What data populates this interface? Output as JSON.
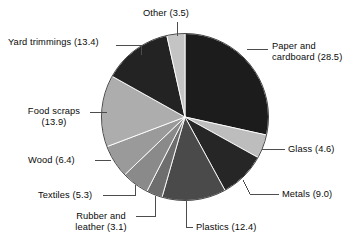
{
  "chart_data": {
    "type": "pie",
    "title": "",
    "subtitle": "",
    "xlabel": "",
    "ylabel": "",
    "legend_position": "callout-labels",
    "grid": false,
    "units": "percent",
    "total": 100.1,
    "start_angle_deg": 0,
    "direction": "clockwise",
    "categories": [
      "Paper and cardboard",
      "Glass",
      "Metals",
      "Plastics",
      "Rubber and leather",
      "Textiles",
      "Wood",
      "Food scraps",
      "Yard trimmings",
      "Other"
    ],
    "values": [
      28.5,
      4.6,
      9.0,
      12.4,
      3.1,
      5.3,
      6.4,
      13.9,
      13.4,
      3.5
    ],
    "slices": [
      {
        "name": "Paper and cardboard",
        "value": 28.5,
        "label": "Paper and\ncardboard (28.5)",
        "color": "#1c1c1c"
      },
      {
        "name": "Glass",
        "value": 4.6,
        "label": "Glass (4.6)",
        "color": "#bdbdbd"
      },
      {
        "name": "Metals",
        "value": 9.0,
        "label": "Metals (9.0)",
        "color": "#262626"
      },
      {
        "name": "Plastics",
        "value": 12.4,
        "label": "Plastics (12.4)",
        "color": "#4a4a4a"
      },
      {
        "name": "Rubber and leather",
        "value": 3.1,
        "label": "Rubber and\nleather (3.1)",
        "color": "#6e6e6e"
      },
      {
        "name": "Textiles",
        "value": 5.3,
        "label": "Textiles (5.3)",
        "color": "#8a8a8a"
      },
      {
        "name": "Wood",
        "value": 6.4,
        "label": "Wood (6.4)",
        "color": "#9a9a9a"
      },
      {
        "name": "Food scraps",
        "value": 13.9,
        "label": "Food scraps\n(13.9)",
        "color": "#adadad"
      },
      {
        "name": "Yard trimmings",
        "value": 13.4,
        "label": "Yard trimmings (13.4)",
        "color": "#232323"
      },
      {
        "name": "Other",
        "value": 3.5,
        "label": "Other (3.5)",
        "color": "#c4c4c4"
      }
    ]
  },
  "labels": {
    "other": "Other (3.5)",
    "paper": "Paper and cardboard (28.5)",
    "paper_line1": "Paper and",
    "paper_line2": "cardboard (28.5)",
    "glass": "Glass (4.6)",
    "metals": "Metals (9.0)",
    "plastics": "Plastics (12.4)",
    "rubber_line1": "Rubber and",
    "rubber_line2": "leather (3.1)",
    "textiles": "Textiles (5.3)",
    "wood": "Wood (6.4)",
    "food_line1": "Food scraps",
    "food_line2": "(13.9)",
    "yard": "Yard trimmings (13.4)"
  },
  "style": {
    "leader_color": "#4d4d4d",
    "slice_border": "#ffffff",
    "background": "#ffffff"
  }
}
